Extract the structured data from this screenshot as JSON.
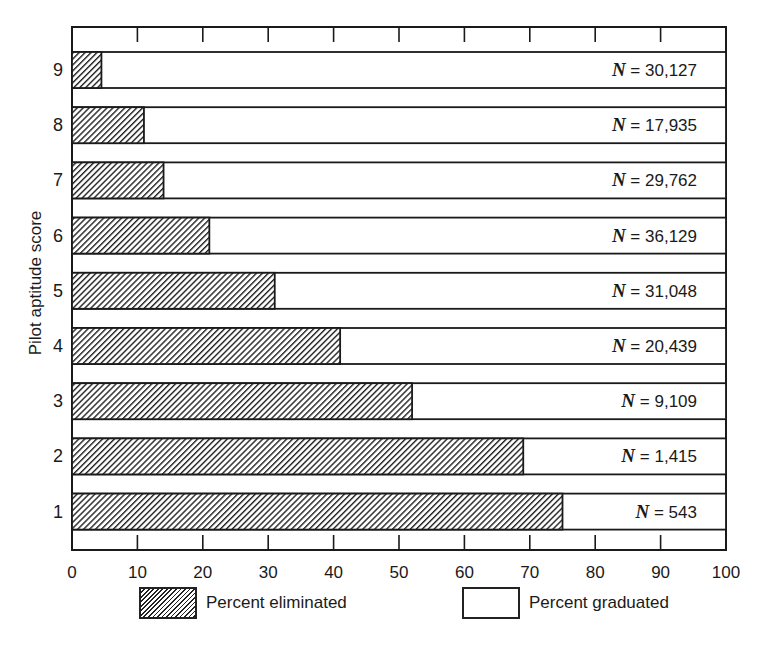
{
  "chart_data": {
    "type": "bar",
    "orientation": "horizontal",
    "stacked": true,
    "title": "",
    "xlabel": "",
    "ylabel": "Pilot aptitude score",
    "xlim": [
      0,
      100
    ],
    "x_ticks": [
      0,
      10,
      20,
      30,
      40,
      50,
      60,
      70,
      80,
      90,
      100
    ],
    "x_tick_labels": [
      "0",
      "10",
      "20",
      "30",
      "40",
      "50",
      "60",
      "70",
      "80",
      "90",
      "100"
    ],
    "categories": [
      "9",
      "8",
      "7",
      "6",
      "5",
      "4",
      "3",
      "2",
      "1"
    ],
    "series": [
      {
        "name": "Percent eliminated",
        "pattern": "hatched",
        "values": [
          4.5,
          11,
          14,
          21,
          31,
          41,
          52,
          69,
          75
        ]
      },
      {
        "name": "Percent graduated",
        "pattern": "white",
        "values": [
          95.5,
          89,
          86,
          79,
          69,
          59,
          48,
          31,
          25
        ]
      }
    ],
    "annotations": [
      {
        "category": "9",
        "text": "N = 30,127",
        "n": 30127
      },
      {
        "category": "8",
        "text": "N = 17,935",
        "n": 17935
      },
      {
        "category": "7",
        "text": "N = 29,762",
        "n": 29762
      },
      {
        "category": "6",
        "text": "N = 36,129",
        "n": 36129
      },
      {
        "category": "5",
        "text": "N = 31,048",
        "n": 31048
      },
      {
        "category": "4",
        "text": "N = 20,439",
        "n": 20439
      },
      {
        "category": "3",
        "text": "N = 9,109",
        "n": 9109
      },
      {
        "category": "2",
        "text": "N = 1,415",
        "n": 1415
      },
      {
        "category": "1",
        "text": "N = 543",
        "n": 543
      }
    ],
    "legend": {
      "position": "bottom",
      "entries": [
        "Percent eliminated",
        "Percent graduated"
      ]
    },
    "grid": false
  },
  "axis": {
    "ylabel": "Pilot aptitude score"
  },
  "legend": {
    "eliminated": "Percent eliminated",
    "graduated": "Percent graduated"
  },
  "colors": {
    "ink": "#1a1a1a",
    "background": "#ffffff"
  }
}
